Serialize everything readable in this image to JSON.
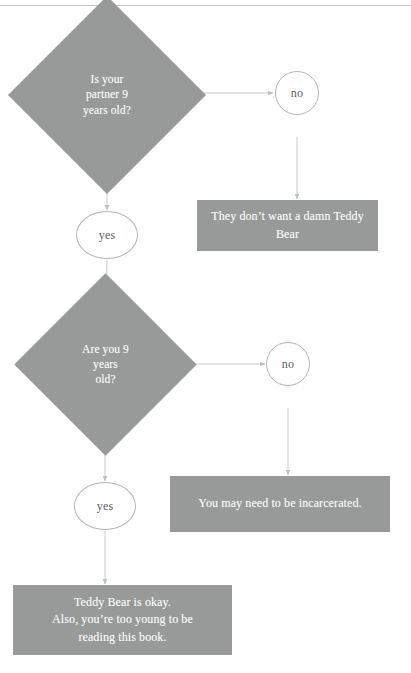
{
  "diagram": {
    "colors": {
      "node_fill": "#989a99",
      "node_text": "#ffffff",
      "oval_stroke": "#b4b6b6",
      "oval_text": "#5d5f5f",
      "edge_stroke": "#c3c5c5",
      "page_rule": "#b9bbbb",
      "background": "#ffffff"
    },
    "nodes": {
      "decision_1": {
        "label": "Is your\npartner 9\nyears old?",
        "shape": "diamond"
      },
      "decision_1_no": {
        "label": "no",
        "shape": "circle"
      },
      "decision_1_yes": {
        "label": "yes",
        "shape": "ellipse"
      },
      "outcome_1": {
        "label": "They don’t want a damn Teddy\nBear",
        "shape": "rectangle"
      },
      "decision_2": {
        "label": "Are you 9\nyears\nold?",
        "shape": "diamond"
      },
      "decision_2_no": {
        "label": "no",
        "shape": "circle"
      },
      "decision_2_yes": {
        "label": "yes",
        "shape": "ellipse"
      },
      "outcome_2": {
        "label": "You may need to be incarcerated.",
        "shape": "rectangle"
      },
      "outcome_3": {
        "label": "Teddy Bear is okay.\nAlso, you’re too young to be\nreading this book.",
        "shape": "rectangle"
      }
    },
    "edges": [
      {
        "from": "decision_1",
        "to": "decision_1_no",
        "label": ""
      },
      {
        "from": "decision_1_no",
        "to": "outcome_1",
        "label": ""
      },
      {
        "from": "decision_1",
        "to": "decision_1_yes",
        "label": ""
      },
      {
        "from": "decision_1_yes",
        "to": "decision_2",
        "label": ""
      },
      {
        "from": "decision_2",
        "to": "decision_2_no",
        "label": ""
      },
      {
        "from": "decision_2_no",
        "to": "outcome_2",
        "label": ""
      },
      {
        "from": "decision_2",
        "to": "decision_2_yes",
        "label": ""
      },
      {
        "from": "decision_2_yes",
        "to": "outcome_3",
        "label": ""
      }
    ]
  }
}
